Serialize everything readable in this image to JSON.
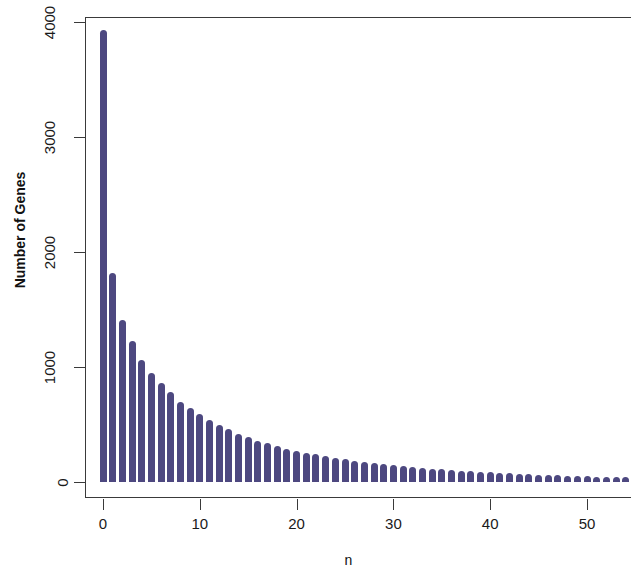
{
  "figure": {
    "width": 631,
    "height": 571,
    "background": "#ffffff",
    "frame_color": "#3a3a3a"
  },
  "axis_titles": {
    "y": "Number of Genes",
    "x": "n"
  },
  "y_ticks": [
    {
      "value": 0,
      "label": "0"
    },
    {
      "value": 1000,
      "label": "1000"
    },
    {
      "value": 2000,
      "label": "2000"
    },
    {
      "value": 3000,
      "label": "3000"
    },
    {
      "value": 4000,
      "label": "4000"
    }
  ],
  "x_ticks": [
    {
      "value": 0,
      "label": "0"
    },
    {
      "value": 10,
      "label": "10"
    },
    {
      "value": 20,
      "label": "20"
    },
    {
      "value": 30,
      "label": "30"
    },
    {
      "value": 40,
      "label": "40"
    },
    {
      "value": 50,
      "label": "50"
    }
  ],
  "chart_data": {
    "type": "bar",
    "title": "",
    "subtitle": "",
    "xlabel": "n",
    "ylabel": "Number of Genes",
    "xlim": [
      -0.8,
      56
    ],
    "ylim": [
      0,
      4050
    ],
    "grid": false,
    "legend": null,
    "bar_color": "#4d4880",
    "bar_width_units": 0.72,
    "categories": [
      0,
      1,
      2,
      3,
      4,
      5,
      6,
      7,
      8,
      9,
      10,
      11,
      12,
      13,
      14,
      15,
      16,
      17,
      18,
      19,
      20,
      21,
      22,
      23,
      24,
      25,
      26,
      27,
      28,
      29,
      30,
      31,
      32,
      33,
      34,
      35,
      36,
      37,
      38,
      39,
      40,
      41,
      42,
      43,
      44,
      45,
      46,
      47,
      48,
      49,
      50,
      51,
      52,
      53,
      54,
      55
    ],
    "values": [
      3930,
      1820,
      1410,
      1230,
      1060,
      950,
      860,
      780,
      700,
      640,
      590,
      540,
      500,
      460,
      420,
      390,
      360,
      340,
      310,
      290,
      270,
      255,
      240,
      225,
      210,
      198,
      186,
      175,
      165,
      155,
      146,
      138,
      130,
      123,
      116,
      110,
      104,
      98,
      93,
      88,
      83,
      79,
      75,
      71,
      67,
      64,
      61,
      58,
      55,
      52,
      50,
      47,
      45,
      43,
      41,
      39
    ]
  }
}
